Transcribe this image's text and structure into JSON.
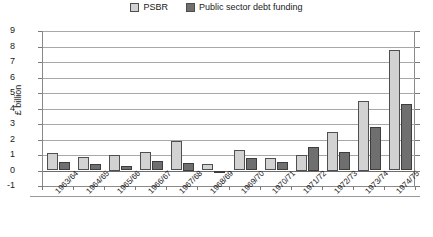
{
  "chart_data": {
    "type": "bar",
    "title": "",
    "xlabel": "",
    "ylabel": "£ billion",
    "ylim": [
      -1,
      9
    ],
    "yticks": [
      9,
      8,
      7,
      6,
      5,
      4,
      3,
      2,
      1,
      0,
      -1
    ],
    "grid": true,
    "legend_position": "top-center",
    "categories": [
      "1963/64",
      "1964/65",
      "1965/66",
      "1966/67",
      "1967/68",
      "1968/69",
      "1969/70",
      "1970/71",
      "1971/72",
      "1972/73",
      "1973/74",
      "1974/75"
    ],
    "series": [
      {
        "name": "PSBR",
        "color": "#d2d2d2",
        "values": [
          1.1,
          0.9,
          1.0,
          1.2,
          1.9,
          0.4,
          1.3,
          0.8,
          1.0,
          2.5,
          4.5,
          7.8
        ]
      },
      {
        "name": "Public sector debt funding",
        "color": "#6f6f6f",
        "values": [
          0.55,
          0.4,
          0.3,
          0.6,
          0.5,
          -0.1,
          0.8,
          0.55,
          1.5,
          1.2,
          2.8,
          4.3
        ]
      }
    ]
  },
  "legend": {
    "items": [
      {
        "label": "PSBR"
      },
      {
        "label": "Public sector debt funding"
      }
    ]
  },
  "axes": {
    "y_title": "£ billion"
  }
}
